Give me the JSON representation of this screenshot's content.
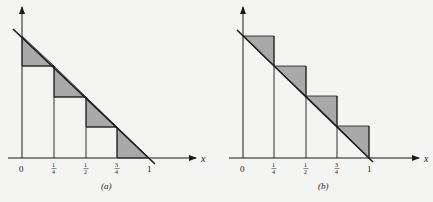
{
  "figure": {
    "colors": {
      "background": "#f4f4f2",
      "stroke": "#1a1a1a",
      "fill": "#a9a9a9",
      "axis": "#333333"
    },
    "panels": [
      {
        "id": "a",
        "caption": "(a)",
        "axis_label": "x",
        "tick_labels": [
          "0",
          "1/4",
          "1/2",
          "3/4",
          "1"
        ],
        "description": "Lower Riemann sum (right endpoints) for decreasing line y = 1 - x on [0,1]; shaded triangles between rectangles and line"
      },
      {
        "id": "b",
        "caption": "(b)",
        "axis_label": "x",
        "tick_labels": [
          "0",
          "1/4",
          "1/2",
          "3/4",
          "1"
        ],
        "description": "Upper Riemann sum (left endpoints) for decreasing line y = 1 - x on [0,1]; shaded triangles between line and rectangles"
      }
    ]
  }
}
